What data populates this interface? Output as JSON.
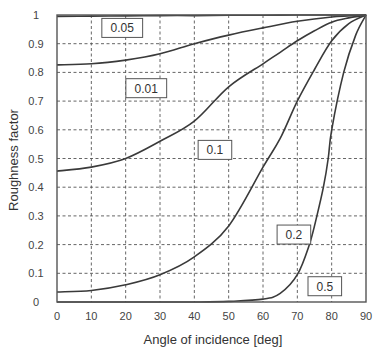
{
  "chart_data": {
    "type": "line",
    "title": "",
    "xlabel": "Angle of incidence [deg]",
    "ylabel": "Roughness factor",
    "xlim": [
      0,
      90
    ],
    "ylim": [
      0,
      1
    ],
    "xticks": [
      0,
      10,
      20,
      30,
      40,
      50,
      60,
      70,
      80,
      90
    ],
    "yticks": [
      0,
      0.1,
      0.2,
      0.3,
      0.4,
      0.5,
      0.6,
      0.7,
      0.8,
      0.9,
      1
    ],
    "xtick_labels": [
      "0",
      "10",
      "20",
      "30",
      "40",
      "50",
      "60",
      "70",
      "80",
      "90"
    ],
    "ytick_labels": [
      "0",
      "0.1",
      "0.2",
      "0.3",
      "0.4",
      "0.5",
      "0.6",
      "0.7",
      "0.8",
      "0.9",
      "1"
    ],
    "grid": true,
    "legend": "inline boxed labels",
    "x": [
      0,
      10,
      20,
      30,
      40,
      50,
      60,
      70,
      80,
      90
    ],
    "series": [
      {
        "name": "0.05",
        "values": [
          0.995,
          0.996,
          0.997,
          0.998,
          0.998,
          0.999,
          0.999,
          1.0,
          1.0,
          1.0
        ],
        "label_pos": {
          "x": 19,
          "y": 0.955
        }
      },
      {
        "name": "0.01",
        "values": [
          0.826,
          0.83,
          0.843,
          0.865,
          0.9,
          0.93,
          0.955,
          0.978,
          0.993,
          1.0
        ],
        "label_pos": {
          "x": 26,
          "y": 0.745
        }
      },
      {
        "name": "0.1",
        "values": [
          0.456,
          0.47,
          0.5,
          0.56,
          0.63,
          0.75,
          0.83,
          0.91,
          0.975,
          1.0
        ],
        "label_pos": {
          "x": 46,
          "y": 0.53
        }
      },
      {
        "name": "0.2",
        "values": [
          0.035,
          0.04,
          0.06,
          0.095,
          0.157,
          0.265,
          0.47,
          0.7,
          0.91,
          1.0
        ],
        "label_pos": {
          "x": 69,
          "y": 0.235
        }
      },
      {
        "name": "0.5",
        "values": [
          0.0,
          0.0,
          0.0,
          0.0,
          0.0,
          0.002,
          0.01,
          0.095,
          0.6,
          1.0
        ],
        "label_pos": {
          "x": 78,
          "y": 0.055
        }
      }
    ],
    "extra_points": {
      "0.5": [
        [
          65,
          0.03
        ],
        [
          73.5,
          0.2
        ],
        [
          75.7,
          0.3
        ],
        [
          77.6,
          0.4
        ],
        [
          79,
          0.5
        ],
        [
          83.5,
          0.8
        ],
        [
          87,
          0.93
        ]
      ],
      "0.2": [
        [
          65,
          0.57
        ],
        [
          75,
          0.81
        ],
        [
          85,
          0.97
        ]
      ],
      "0.1": [
        [
          65,
          0.87
        ],
        [
          75,
          0.945
        ],
        [
          85,
          0.99
        ]
      ]
    }
  },
  "colors": {
    "curve": "#3a3a3a",
    "grid": "#555555",
    "background": "#ffffff"
  }
}
